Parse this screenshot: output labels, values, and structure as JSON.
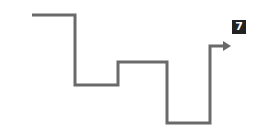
{
  "diagram": {
    "type": "stepped-path-with-arrow",
    "stroke_color": "#6a6a6a",
    "stroke_width": 3,
    "path_points": [
      [
        32,
        15
      ],
      [
        75,
        15
      ],
      [
        75,
        85
      ],
      [
        118,
        85
      ],
      [
        118,
        62
      ],
      [
        167,
        62
      ],
      [
        167,
        123
      ],
      [
        210,
        123
      ],
      [
        210,
        46
      ],
      [
        224,
        46
      ]
    ],
    "arrow": {
      "tip": [
        231,
        46
      ],
      "direction": "right"
    },
    "badge": {
      "label": "7",
      "background": "#222222",
      "text_color": "#ffffff"
    }
  }
}
